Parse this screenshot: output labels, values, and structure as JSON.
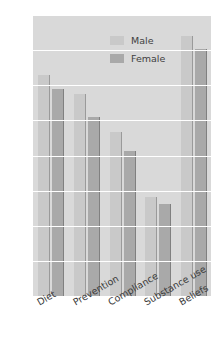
{
  "chart_data": {
    "type": "bar",
    "title": "",
    "subtitle": "",
    "xlabel": "",
    "ylabel": "",
    "categories": [
      "Diet",
      "Prevention",
      "Compliance",
      "Substance use",
      "Beliefs"
    ],
    "series": [
      {
        "name": "Male",
        "color": "#c9c9c9",
        "values": [
          3.15,
          2.88,
          2.33,
          1.41,
          3.7
        ]
      },
      {
        "name": "Female",
        "color": "#a9a9a9",
        "values": [
          2.94,
          2.55,
          2.07,
          1.31,
          3.52
        ]
      }
    ],
    "ylim": [
      0,
      4
    ],
    "yticks": [
      "0",
      "0.5",
      "1",
      "1.5",
      "2",
      "2.5",
      "3",
      "3.5",
      "4"
    ],
    "ytick_values": [
      0,
      0.5,
      1,
      1.5,
      2,
      2.5,
      3,
      3.5,
      4
    ],
    "grid": true,
    "grid_axis": "y",
    "grid_color": "#ffffff",
    "legend_position": "top-right",
    "plot_background": "#d9d9d9",
    "figure_background": "#ffffff",
    "xtick_rotation": -30
  },
  "legend": {
    "entries": [
      {
        "label": "Male"
      },
      {
        "label": "Female"
      }
    ]
  }
}
